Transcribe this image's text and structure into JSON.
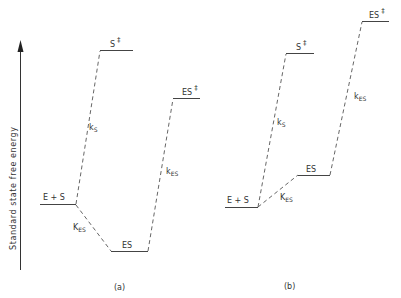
{
  "diagram": {
    "axis": {
      "label": "Standard state free energy",
      "direction": "up"
    },
    "panels": [
      {
        "id": "a",
        "caption": "(a)",
        "levels": [
          {
            "name": "E + S",
            "label": "E + S"
          },
          {
            "name": "S‡",
            "label_main": "S",
            "label_sup": "‡"
          },
          {
            "name": "ES",
            "label": "ES"
          },
          {
            "name": "ES‡",
            "label_main": "ES",
            "label_sup": "‡"
          }
        ],
        "transitions": [
          {
            "from": "E + S",
            "to": "S‡",
            "label_main": "k",
            "label_sub": "S"
          },
          {
            "from": "E + S",
            "to": "ES",
            "label_main": "K",
            "label_sub": "ES"
          },
          {
            "from": "ES",
            "to": "ES‡",
            "label_main": "k",
            "label_sub": "ES"
          }
        ]
      },
      {
        "id": "b",
        "caption": "(b)",
        "levels": [
          {
            "name": "E + S",
            "label": "E + S"
          },
          {
            "name": "S‡",
            "label_main": "S",
            "label_sup": "‡"
          },
          {
            "name": "ES",
            "label": "ES"
          },
          {
            "name": "ES‡",
            "label_main": "ES",
            "label_sup": "‡"
          }
        ],
        "transitions": [
          {
            "from": "E + S",
            "to": "S‡",
            "label_main": "k",
            "label_sub": "S"
          },
          {
            "from": "E + S",
            "to": "ES",
            "label_main": "K",
            "label_sub": "ES"
          },
          {
            "from": "ES",
            "to": "ES‡",
            "label_main": "k",
            "label_sub": "ES"
          }
        ]
      }
    ]
  }
}
